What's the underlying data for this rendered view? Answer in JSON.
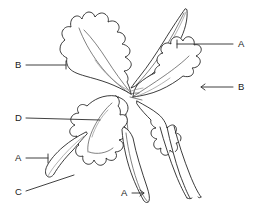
{
  "diagram": {
    "style": "black-and-white-line-art",
    "background_color": "#ffffff",
    "line_color": "#1a1a1a",
    "width": 259,
    "height": 223
  },
  "labels": [
    {
      "id": "label-a-right",
      "text": "A",
      "position": "right-upper",
      "x": 241,
      "y": 44,
      "leader": "horizontal line from label left to upper-right sepal",
      "points_to": "upper-right-sepal"
    },
    {
      "id": "label-b-left",
      "text": "B",
      "position": "left-upper",
      "x": 18,
      "y": 65,
      "leader": "horizontal line from label right to upper-left petal edge",
      "points_to": "upper-left-petal"
    },
    {
      "id": "label-b-right",
      "text": "B",
      "position": "right-middle",
      "x": 241,
      "y": 87,
      "leader": "horizontal line with arrowhead pointing left into right petal",
      "points_to": "right-lateral-petal"
    },
    {
      "id": "label-d-left",
      "text": "D",
      "position": "left-middle",
      "x": 18,
      "y": 118,
      "leader": "horizontal line from label right to column callus",
      "points_to": "column-callus"
    },
    {
      "id": "label-a-left",
      "text": "A",
      "position": "left-lower",
      "x": 18,
      "y": 158,
      "leader": "short angled line to lower-left sepal",
      "points_to": "lower-left-sepal"
    },
    {
      "id": "label-c-left",
      "text": "C",
      "position": "left-bottom",
      "x": 18,
      "y": 193,
      "leader": "diagonal line up and right to ruffled lip margin",
      "points_to": "labellum-lip-margin"
    },
    {
      "id": "label-a-bottom",
      "text": "A",
      "position": "bottom-center",
      "x": 124,
      "y": 193,
      "leader": "horizontal line with arrowhead pointing right to lower sepal",
      "points_to": "lower-center-sepal"
    }
  ],
  "flower_parts": [
    {
      "id": "upper-left-petal",
      "name": "Upper left petal with ruffled margin"
    },
    {
      "id": "upper-right-sepal",
      "name": "Upper right narrow sepal"
    },
    {
      "id": "right-lateral-petal",
      "name": "Right lateral petal with ruffled margin"
    },
    {
      "id": "labellum-lip",
      "name": "Labellum (lip) with frilled margin"
    },
    {
      "id": "column-callus",
      "name": "Column and callus at flower center"
    },
    {
      "id": "lower-left-sepal",
      "name": "Lower left sepal"
    },
    {
      "id": "lower-center-sepal",
      "name": "Lower center sepal"
    },
    {
      "id": "lower-right-sepals",
      "name": "Lower right sepal strips"
    }
  ]
}
